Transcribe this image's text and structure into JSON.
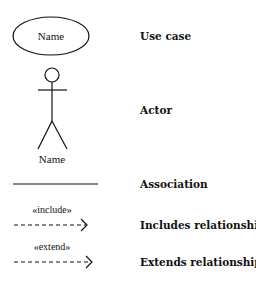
{
  "legend": {
    "items": [
      {
        "symbol": "use-case-ellipse",
        "symbol_text": "Name",
        "label": "Use case"
      },
      {
        "symbol": "actor-stick-figure",
        "symbol_text": "Name",
        "label": "Actor"
      },
      {
        "symbol": "solid-line",
        "symbol_text": "",
        "label": "Association"
      },
      {
        "symbol": "dashed-arrow",
        "symbol_text": "«include»",
        "label": "Includes relationship"
      },
      {
        "symbol": "dashed-arrow",
        "symbol_text": "«extend»",
        "label": "Extends relationship..."
      }
    ]
  },
  "colors": {
    "stroke": "#111111",
    "background": "#ffffff"
  }
}
